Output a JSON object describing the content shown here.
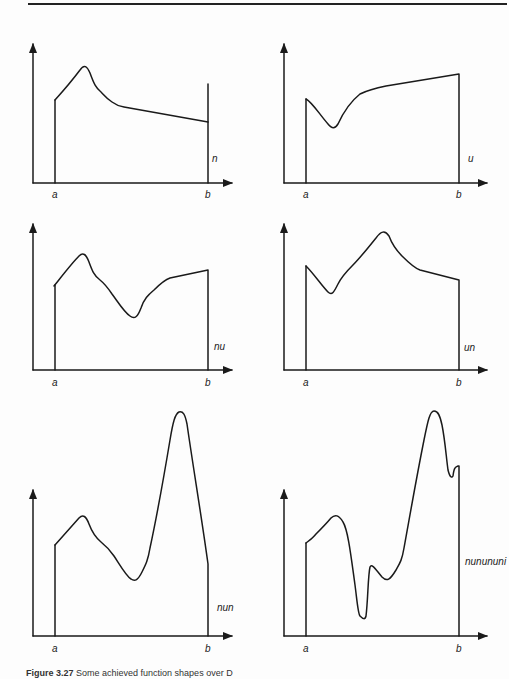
{
  "figure": {
    "caption_number": "Figure 3.27",
    "caption_text": "Some achieved function shapes over D",
    "axis_labels": {
      "left": "a",
      "right": "b"
    },
    "colors": {
      "line": "#1a1a1a",
      "background": "#fdfdfd"
    },
    "panels": [
      {
        "id": "n",
        "label": "n",
        "shape": "single peak near a, then decline"
      },
      {
        "id": "u",
        "label": "u",
        "shape": "single dip near a, then rise"
      },
      {
        "id": "nu",
        "label": "nu",
        "shape": "peak then dip then rise"
      },
      {
        "id": "un",
        "label": "un",
        "shape": "dip then peak then decline"
      },
      {
        "id": "nun",
        "label": "nun",
        "shape": "peak, dip, tall peak, fall"
      },
      {
        "id": "nunununi",
        "label": "nunununi",
        "shape": "multiple peaks and dips"
      }
    ]
  }
}
